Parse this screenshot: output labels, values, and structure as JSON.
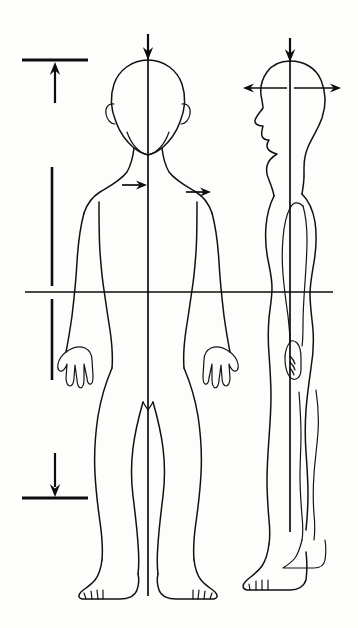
{
  "document": {
    "title": "Human Body Postural Alignment Diagram",
    "description": "Line drawing of a standing human figure shown in anterior (front) view and lateral (side) view, with plumb lines, a transverse reference line, and directional force arrows.",
    "background_color": "#fdfdfc",
    "ink_color": "#111111",
    "width": 358,
    "height": 628
  },
  "figures": [
    {
      "id": "anterior-figure",
      "name": "Anterior view figure",
      "view": "front",
      "center_x": 148,
      "plumb_line": {
        "x": 148,
        "y_top": 48,
        "y_bottom": 596
      }
    },
    {
      "id": "lateral-figure",
      "name": "Lateral view figure",
      "view": "side",
      "center_x": 290,
      "plumb_line": {
        "x": 290,
        "y_top": 48,
        "y_bottom": 532
      }
    }
  ],
  "reference_lines": [
    {
      "id": "transverse-line",
      "name": "Transverse reference line",
      "orientation": "horizontal",
      "y": 292,
      "x_start": 25,
      "x_end": 333
    },
    {
      "id": "head-transverse-line",
      "name": "Head transverse axis",
      "orientation": "horizontal",
      "y": 88,
      "x_start": 243,
      "x_end": 341
    }
  ],
  "gauges": [
    {
      "id": "upper-gauge",
      "name": "Upper measurement gauge",
      "bar_y": 60,
      "bar_x_start": 22,
      "bar_x_end": 88,
      "arrow_direction": "up",
      "arrow_x": 55,
      "arrow_y_start": 103,
      "arrow_y_end": 63
    },
    {
      "id": "middle-gauge",
      "name": "Middle measurement gauge",
      "orientation": "vertical",
      "x": 52,
      "y_start": 167,
      "y_end": 380,
      "gap_at_y": 292
    },
    {
      "id": "lower-gauge",
      "name": "Lower measurement gauge",
      "bar_y": 498,
      "bar_x_start": 22,
      "bar_x_end": 88,
      "arrow_direction": "down",
      "arrow_x": 55,
      "arrow_y_start": 453,
      "arrow_y_end": 495
    }
  ],
  "force_arrows": [
    {
      "id": "crown-arrow-anterior",
      "name": "Downward arrow at crown of anterior head",
      "direction": "down",
      "x": 148,
      "y_start": 34,
      "y_end": 60
    },
    {
      "id": "crown-arrow-lateral",
      "name": "Downward arrow at crown of lateral head",
      "direction": "down",
      "x": 290,
      "y_start": 38,
      "y_end": 62
    },
    {
      "id": "chest-arrow-left",
      "name": "Rightward arrow at left chest",
      "direction": "right",
      "y": 185,
      "x_start": 122,
      "x_end": 147
    },
    {
      "id": "chest-arrow-right",
      "name": "Rightward arrow at right chest",
      "direction": "right",
      "y": 192,
      "x_start": 186,
      "x_end": 211
    },
    {
      "id": "head-arrow-anterior-left",
      "name": "Leftward arrow from lateral head",
      "direction": "left",
      "y": 88,
      "x_start": 287,
      "x_end": 243
    },
    {
      "id": "head-arrow-posterior-right",
      "name": "Rightward arrow from lateral head",
      "direction": "right",
      "y": 88,
      "x_start": 294,
      "x_end": 341
    }
  ]
}
